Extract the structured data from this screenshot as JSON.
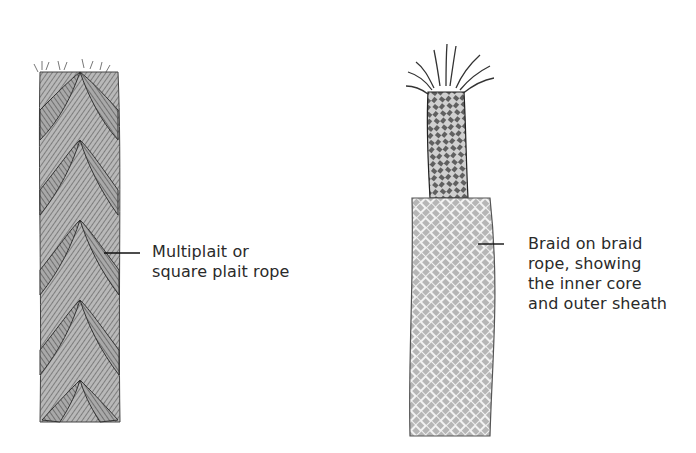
{
  "illustrations": [
    {
      "id": "multiplait",
      "label_lines": [
        "Multiplait or",
        "square plait rope"
      ]
    },
    {
      "id": "braid-on-braid",
      "label_lines": [
        "Braid on braid",
        "rope, showing",
        "the inner core",
        "and outer sheath"
      ]
    }
  ],
  "colors": {
    "background": "#ffffff",
    "ink": "#2a2a2a",
    "rope_shade": "#8a8a8a"
  }
}
